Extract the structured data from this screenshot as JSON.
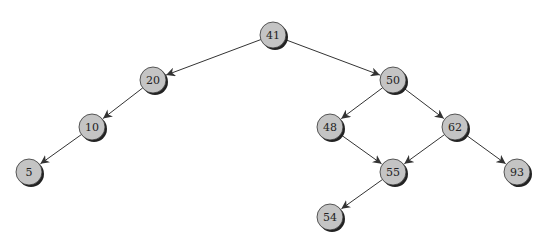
{
  "diagram": {
    "type": "binary-search-tree",
    "colors": {
      "node_fill": "#c4c4c4",
      "node_stroke": "#333333",
      "shadow": "#222222",
      "edge": "#333333"
    },
    "nodes": [
      {
        "id": "n41",
        "label": "41",
        "x": 273,
        "y": 35
      },
      {
        "id": "n20",
        "label": "20",
        "x": 153,
        "y": 80
      },
      {
        "id": "n50",
        "label": "50",
        "x": 393,
        "y": 80
      },
      {
        "id": "n10",
        "label": "10",
        "x": 92,
        "y": 127
      },
      {
        "id": "n48",
        "label": "48",
        "x": 330,
        "y": 127
      },
      {
        "id": "n62",
        "label": "62",
        "x": 455,
        "y": 127
      },
      {
        "id": "n5",
        "label": "5",
        "x": 29,
        "y": 172
      },
      {
        "id": "n55",
        "label": "55",
        "x": 393,
        "y": 172
      },
      {
        "id": "n93",
        "label": "93",
        "x": 517,
        "y": 172
      },
      {
        "id": "n54",
        "label": "54",
        "x": 330,
        "y": 217
      }
    ],
    "edges": [
      {
        "from": "n41",
        "to": "n20"
      },
      {
        "from": "n41",
        "to": "n50"
      },
      {
        "from": "n20",
        "to": "n10"
      },
      {
        "from": "n10",
        "to": "n5"
      },
      {
        "from": "n50",
        "to": "n48"
      },
      {
        "from": "n50",
        "to": "n62"
      },
      {
        "from": "n48",
        "to": "n55"
      },
      {
        "from": "n62",
        "to": "n55"
      },
      {
        "from": "n62",
        "to": "n93"
      },
      {
        "from": "n55",
        "to": "n54"
      }
    ]
  }
}
